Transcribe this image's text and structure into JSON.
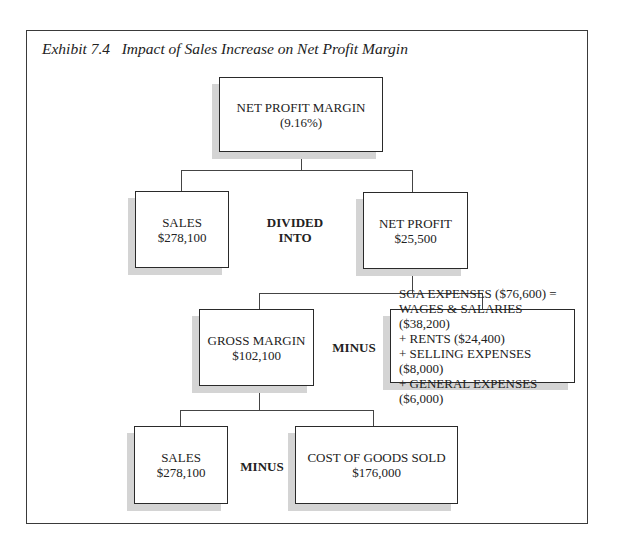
{
  "exhibit": {
    "title": "Exhibit 7.4   Impact of Sales Increase on Net Profit Margin"
  },
  "nodes": {
    "net_profit_margin": {
      "label": "NET PROFIT MARGIN",
      "value": "(9.16%)"
    },
    "sales_top": {
      "label": "SALES",
      "value": "$278,100"
    },
    "net_profit": {
      "label": "NET PROFIT",
      "value": "$25,500"
    },
    "gross_margin": {
      "label": "GROSS MARGIN",
      "value": "$102,100"
    },
    "sga": {
      "lines": [
        "SGA EXPENSES ($76,600) =",
        "WAGES & SALARIES ($38,200)",
        "+ RENTS ($24,400)",
        "+ SELLING EXPENSES ($8,000)",
        "+ GENERAL EXPENSES ($6,000)"
      ]
    },
    "sales_bottom": {
      "label": "SALES",
      "value": "$278,100"
    },
    "cogs": {
      "label": "COST OF GOODS SOLD",
      "value": "$176,000"
    }
  },
  "operators": {
    "divided_into": {
      "line1": "DIVIDED",
      "line2": "INTO"
    },
    "minus_middle": "MINUS",
    "minus_bottom": "MINUS"
  },
  "colors": {
    "border": "#2a2a2a",
    "shadow": "#d4d4d4",
    "text": "#222222"
  }
}
